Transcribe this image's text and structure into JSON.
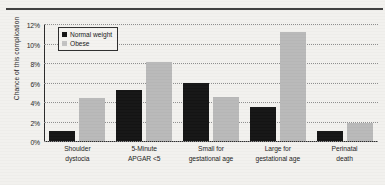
{
  "chart_data": {
    "type": "bar",
    "title": "",
    "xlabel": "",
    "ylabel": "Chance of this complication",
    "ylim": [
      0,
      12
    ],
    "ytick_labels": [
      "0%",
      "2%",
      "4%",
      "6%",
      "8%",
      "10%",
      "12%"
    ],
    "ytick_values": [
      0,
      2,
      4,
      6,
      8,
      10,
      12
    ],
    "grid": true,
    "legend_position": "top-left",
    "units": "percent",
    "categories": [
      "Shoulder dystocia",
      "5-Minute APGAR <5",
      "Small for gestational age",
      "Large for gestational age",
      "Perinatal death"
    ],
    "category_lines": [
      [
        "Shoulder",
        "dystocia"
      ],
      [
        "5-Minute",
        "APGAR <5"
      ],
      [
        "Small for",
        "gestational age"
      ],
      [
        "Large for",
        "gestational age"
      ],
      [
        "Perinatal",
        "death"
      ]
    ],
    "series": [
      {
        "name": "Normal weight",
        "color": "#141414",
        "values": [
          1.0,
          5.2,
          5.9,
          3.5,
          1.0
        ]
      },
      {
        "name": "Obese",
        "color": "#b9b9b9",
        "values": [
          4.4,
          8.1,
          4.5,
          11.2,
          1.8
        ]
      }
    ]
  }
}
